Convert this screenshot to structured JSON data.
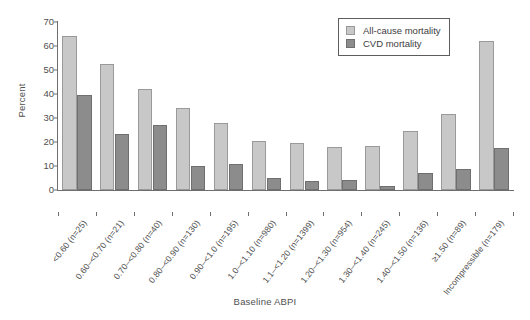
{
  "chart_data": {
    "type": "bar",
    "title": "",
    "xlabel": "Baseline ABPI",
    "ylabel": "Percent",
    "ylim": [
      0,
      70
    ],
    "yticks": [
      0,
      10,
      20,
      30,
      40,
      50,
      60,
      70
    ],
    "grid": false,
    "legend_position": "top-right",
    "categories": [
      "<0.60 (n=25)",
      "0.60–<0.70 (n=21)",
      "0.70–<0.80 (n=40)",
      "0.80–<0.90 (n=130)",
      "0.90–<1.0 (n=195)",
      "1.0–<1.10 (n=980)",
      "1.1–<1.20 (n=1399)",
      "1.20–<1.30 (n=954)",
      "1.30–<1.40 (n=245)",
      "1.40–<1.50 (n=136)",
      "≥1.50 (n=89)",
      "Incompressible (n=179)"
    ],
    "series": [
      {
        "name": "All-cause mortality",
        "color": "#c8c8c8",
        "values": [
          64.0,
          52.3,
          42.0,
          34.3,
          28.0,
          20.3,
          19.5,
          17.8,
          18.5,
          24.6,
          31.5,
          62.0
        ]
      },
      {
        "name": "CVD mortality",
        "color": "#8c8c8c",
        "values": [
          39.7,
          23.3,
          27.2,
          9.8,
          10.8,
          5.0,
          3.6,
          4.0,
          1.5,
          7.2,
          8.6,
          17.4
        ]
      }
    ]
  },
  "legend": {
    "items": [
      {
        "label": "All-cause mortality",
        "swatch": "light-gray-swatch"
      },
      {
        "label": "CVD mortality",
        "swatch": "dark-gray-swatch"
      }
    ]
  },
  "colors": {
    "all_cause": "#c8c8c8",
    "cvd": "#8c8c8c",
    "axis": "#6e6e6e",
    "text": "#4f4f4f",
    "background": "#ffffff"
  }
}
